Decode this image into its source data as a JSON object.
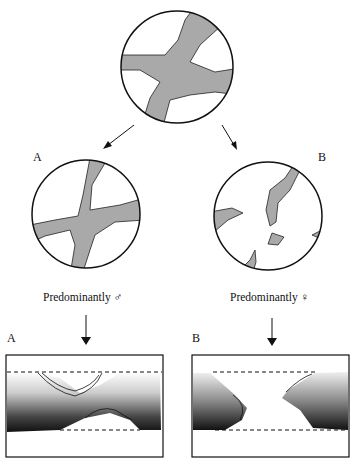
{
  "figure": {
    "panel_a_label": "A",
    "panel_b_label": "B",
    "panel_a_caption": "Predominantly ♂",
    "panel_b_caption": "Predominantly ♀",
    "bottom_a_label": "A",
    "bottom_b_label": "B",
    "colors": {
      "bone": "#a9a9a9",
      "line": "#111111",
      "bg": "#ffffff"
    }
  }
}
